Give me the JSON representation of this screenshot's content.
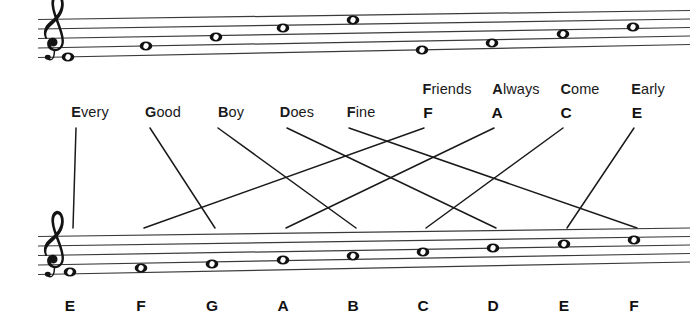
{
  "figure": {
    "ink_color": "#1a1a1a",
    "staff_line_color": "#3a3a3a",
    "background": "#ffffff"
  },
  "top_staff": {
    "clef": "treble-clef",
    "description": "Staff showing line notes E G B D F and space notes F A C E, drawn with a slight upward tilt",
    "notes": [
      {
        "label": "E",
        "position": "line-1",
        "x": 68,
        "y": 57
      },
      {
        "label": "G",
        "position": "line-2",
        "x": 146,
        "y": 46
      },
      {
        "label": "B",
        "position": "line-3",
        "x": 216,
        "y": 37
      },
      {
        "label": "D",
        "position": "line-4",
        "x": 283,
        "y": 28
      },
      {
        "label": "F",
        "position": "line-5",
        "x": 353,
        "y": 20
      },
      {
        "label": "F",
        "position": "space-1",
        "x": 422,
        "y": 50
      },
      {
        "label": "A",
        "position": "space-2",
        "x": 492,
        "y": 43
      },
      {
        "label": "C",
        "position": "space-3",
        "x": 563,
        "y": 34
      },
      {
        "label": "E",
        "position": "space-4",
        "x": 633,
        "y": 27
      }
    ]
  },
  "bottom_staff": {
    "clef": "treble-clef",
    "description": "Staff showing the ascending scale E F G A B C D E F",
    "notes": [
      {
        "label": "E",
        "x": 70,
        "y": 272
      },
      {
        "label": "F",
        "x": 141,
        "y": 268
      },
      {
        "label": "G",
        "x": 212,
        "y": 264
      },
      {
        "label": "A",
        "x": 283,
        "y": 260
      },
      {
        "label": "B",
        "x": 353,
        "y": 256
      },
      {
        "label": "C",
        "x": 423,
        "y": 252
      },
      {
        "label": "D",
        "x": 493,
        "y": 248
      },
      {
        "label": "E",
        "x": 564,
        "y": 244
      },
      {
        "label": "F",
        "x": 634,
        "y": 240
      }
    ]
  },
  "mnemonics": {
    "line_notes_row": {
      "caption": "Every Good Boy Does Fine",
      "items": [
        {
          "initial": "E",
          "rest": "very",
          "x": 90,
          "y": 112
        },
        {
          "initial": "G",
          "rest": "ood",
          "x": 163,
          "y": 112
        },
        {
          "initial": "B",
          "rest": "oy",
          "x": 231,
          "y": 112
        },
        {
          "initial": "D",
          "rest": "oes",
          "x": 297,
          "y": 112
        },
        {
          "initial": "F",
          "rest": "ine",
          "x": 361,
          "y": 112
        }
      ]
    },
    "space_notes_row": {
      "caption": "Friends Always Come Early",
      "items": [
        {
          "initial": "F",
          "rest": "riends",
          "x": 447,
          "y": 89
        },
        {
          "initial": "A",
          "rest": "lways",
          "x": 516,
          "y": 89
        },
        {
          "initial": "C",
          "rest": "ome",
          "x": 580,
          "y": 89
        },
        {
          "initial": "E",
          "rest": "arly",
          "x": 648,
          "y": 89
        }
      ]
    },
    "initial_letters_row": [
      {
        "label": "F",
        "x": 428,
        "y": 112
      },
      {
        "label": "A",
        "x": 497,
        "y": 112
      },
      {
        "label": "C",
        "x": 566,
        "y": 112
      },
      {
        "label": "E",
        "x": 637,
        "y": 112
      }
    ]
  },
  "bottom_letters": [
    {
      "label": "E",
      "x": 70
    },
    {
      "label": "F",
      "x": 141
    },
    {
      "label": "G",
      "x": 212
    },
    {
      "label": "A",
      "x": 283
    },
    {
      "label": "B",
      "x": 353
    },
    {
      "label": "C",
      "x": 423
    },
    {
      "label": "D",
      "x": 493
    },
    {
      "label": "E",
      "x": 564
    },
    {
      "label": "F",
      "x": 634
    }
  ],
  "connectors": [
    {
      "from": "Every",
      "to": "E",
      "x1": 76,
      "y1": 128,
      "x2": 73,
      "y2": 228
    },
    {
      "from": "Good",
      "to": "G",
      "x1": 150,
      "y1": 128,
      "x2": 215,
      "y2": 228
    },
    {
      "from": "Boy",
      "to": "B",
      "x1": 218,
      "y1": 128,
      "x2": 356,
      "y2": 228
    },
    {
      "from": "Does",
      "to": "D",
      "x1": 287,
      "y1": 128,
      "x2": 496,
      "y2": 228
    },
    {
      "from": "Fine",
      "to": "F",
      "x1": 349,
      "y1": 128,
      "x2": 637,
      "y2": 228
    },
    {
      "from": "F",
      "to": "F",
      "x1": 424,
      "y1": 128,
      "x2": 144,
      "y2": 228
    },
    {
      "from": "A",
      "to": "A",
      "x1": 494,
      "y1": 128,
      "x2": 286,
      "y2": 228
    },
    {
      "from": "C",
      "to": "C",
      "x1": 563,
      "y1": 128,
      "x2": 426,
      "y2": 228
    },
    {
      "from": "E",
      "to": "E",
      "x1": 634,
      "y1": 128,
      "x2": 567,
      "y2": 228
    }
  ]
}
